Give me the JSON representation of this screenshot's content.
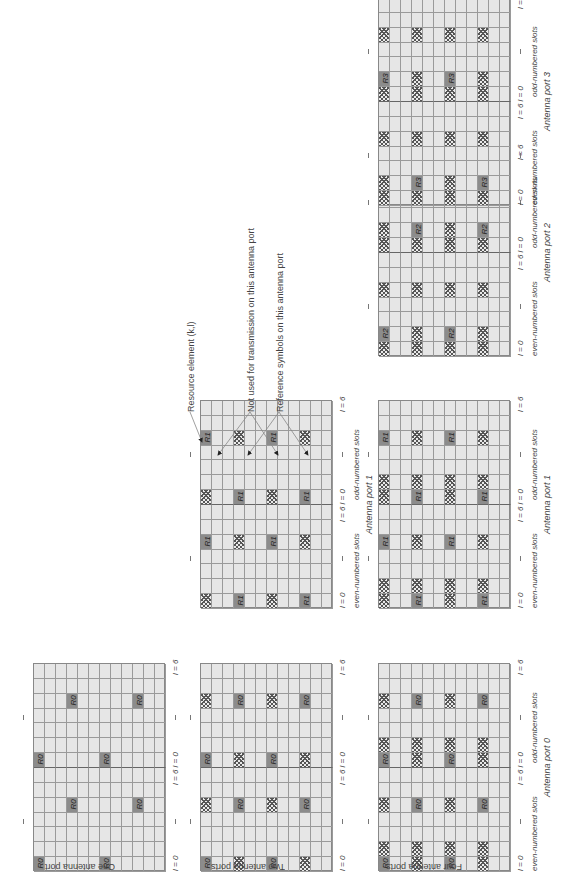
{
  "figure": {
    "row_labels": {
      "one": "One antenna port",
      "two": "Two antenna ports",
      "four": "Four antenna ports"
    },
    "axis_labels": {
      "l0": "l = 0",
      "l6l0": "l = 6 l = 0",
      "l6": "l = 6",
      "even": "even-numbered slots",
      "odd": "odd-numbered slots"
    },
    "port_labels": [
      "Antenna port 0",
      "Antenna port 1",
      "Antenna port 2",
      "Antenna port 3"
    ],
    "legend": {
      "resource_element": "Resource element (k,l)",
      "not_used": "Not used for transmission on this antenna port",
      "reference": "Reference symbols on this antenna port"
    },
    "colors": {
      "grid_bg": "#e6e6e6",
      "grid_line": "#9a9a9a",
      "ref_symbol": "#8c8c8c",
      "hatch": "#555555"
    },
    "grid": {
      "subcarriers": 12,
      "symbols": 14
    }
  },
  "grids": [
    {
      "id": "one-p0",
      "col": 0,
      "row": 0,
      "port": 0,
      "ref": "R0",
      "refs": [
        [
          0,
          0
        ],
        [
          6,
          0
        ],
        [
          3,
          4
        ],
        [
          9,
          4
        ],
        [
          0,
          7
        ],
        [
          6,
          7
        ],
        [
          3,
          11
        ],
        [
          9,
          11
        ]
      ],
      "hatch": []
    },
    {
      "id": "two-p0",
      "col": 1,
      "row": 0,
      "port": 0,
      "ref": "R0",
      "refs": [
        [
          0,
          0
        ],
        [
          6,
          0
        ],
        [
          3,
          4
        ],
        [
          9,
          4
        ],
        [
          0,
          7
        ],
        [
          6,
          7
        ],
        [
          3,
          11
        ],
        [
          9,
          11
        ]
      ],
      "hatch": [
        [
          3,
          0
        ],
        [
          9,
          0
        ],
        [
          0,
          4
        ],
        [
          6,
          4
        ],
        [
          3,
          7
        ],
        [
          9,
          7
        ],
        [
          0,
          11
        ],
        [
          6,
          11
        ]
      ]
    },
    {
      "id": "two-p1",
      "col": 1,
      "row": 1,
      "port": 1,
      "ref": "R1",
      "refs": [
        [
          3,
          0
        ],
        [
          9,
          0
        ],
        [
          0,
          4
        ],
        [
          6,
          4
        ],
        [
          3,
          7
        ],
        [
          9,
          7
        ],
        [
          0,
          11
        ],
        [
          6,
          11
        ]
      ],
      "hatch": [
        [
          0,
          0
        ],
        [
          6,
          0
        ],
        [
          3,
          4
        ],
        [
          9,
          4
        ],
        [
          0,
          7
        ],
        [
          6,
          7
        ],
        [
          3,
          11
        ],
        [
          9,
          11
        ]
      ]
    },
    {
      "id": "four-p0",
      "col": 2,
      "row": 0,
      "port": 0,
      "ref": "R0",
      "refs": [
        [
          0,
          0
        ],
        [
          6,
          0
        ],
        [
          3,
          4
        ],
        [
          9,
          4
        ],
        [
          0,
          7
        ],
        [
          6,
          7
        ],
        [
          3,
          11
        ],
        [
          9,
          11
        ]
      ],
      "hatch": [
        [
          3,
          0
        ],
        [
          9,
          0
        ],
        [
          0,
          4
        ],
        [
          6,
          4
        ],
        [
          3,
          7
        ],
        [
          9,
          7
        ],
        [
          0,
          11
        ],
        [
          6,
          11
        ],
        [
          0,
          1
        ],
        [
          3,
          1
        ],
        [
          6,
          1
        ],
        [
          9,
          1
        ],
        [
          0,
          8
        ],
        [
          3,
          8
        ],
        [
          6,
          8
        ],
        [
          9,
          8
        ]
      ]
    },
    {
      "id": "four-p1",
      "col": 2,
      "row": 1,
      "port": 1,
      "ref": "R1",
      "refs": [
        [
          3,
          0
        ],
        [
          9,
          0
        ],
        [
          0,
          4
        ],
        [
          6,
          4
        ],
        [
          3,
          7
        ],
        [
          9,
          7
        ],
        [
          0,
          11
        ],
        [
          6,
          11
        ]
      ],
      "hatch": [
        [
          0,
          0
        ],
        [
          6,
          0
        ],
        [
          3,
          4
        ],
        [
          9,
          4
        ],
        [
          0,
          7
        ],
        [
          6,
          7
        ],
        [
          3,
          11
        ],
        [
          9,
          11
        ],
        [
          0,
          1
        ],
        [
          3,
          1
        ],
        [
          6,
          1
        ],
        [
          9,
          1
        ],
        [
          0,
          8
        ],
        [
          3,
          8
        ],
        [
          6,
          8
        ],
        [
          9,
          8
        ]
      ]
    },
    {
      "id": "four-p2",
      "col": 2,
      "row": 2,
      "port": 2,
      "ref": "R2",
      "refs": [
        [
          0,
          1
        ],
        [
          6,
          1
        ],
        [
          3,
          8
        ],
        [
          9,
          8
        ]
      ],
      "hatch": [
        [
          3,
          1
        ],
        [
          9,
          1
        ],
        [
          0,
          8
        ],
        [
          6,
          8
        ],
        [
          0,
          0
        ],
        [
          3,
          0
        ],
        [
          6,
          0
        ],
        [
          9,
          0
        ],
        [
          0,
          4
        ],
        [
          3,
          4
        ],
        [
          6,
          4
        ],
        [
          9,
          4
        ],
        [
          0,
          7
        ],
        [
          3,
          7
        ],
        [
          6,
          7
        ],
        [
          9,
          7
        ],
        [
          0,
          11
        ],
        [
          3,
          11
        ],
        [
          6,
          11
        ],
        [
          9,
          11
        ]
      ]
    },
    {
      "id": "four-p3",
      "col": 2,
      "row": 3,
      "port": 3,
      "ref": "R3",
      "refs": [
        [
          3,
          1
        ],
        [
          9,
          1
        ],
        [
          0,
          8
        ],
        [
          6,
          8
        ]
      ],
      "hatch": [
        [
          0,
          1
        ],
        [
          6,
          1
        ],
        [
          3,
          8
        ],
        [
          9,
          8
        ],
        [
          0,
          0
        ],
        [
          3,
          0
        ],
        [
          6,
          0
        ],
        [
          9,
          0
        ],
        [
          0,
          4
        ],
        [
          3,
          4
        ],
        [
          6,
          4
        ],
        [
          9,
          4
        ],
        [
          0,
          7
        ],
        [
          3,
          7
        ],
        [
          6,
          7
        ],
        [
          9,
          7
        ],
        [
          0,
          11
        ],
        [
          3,
          11
        ],
        [
          6,
          11
        ],
        [
          9,
          11
        ]
      ]
    }
  ],
  "chart_data": {
    "type": "diagram",
    "configurations": [
      "One antenna port",
      "Two antenna ports",
      "Four antenna ports"
    ],
    "ports": [
      "Antenna port 0",
      "Antenna port 1",
      "Antenna port 2",
      "Antenna port 3"
    ],
    "symbols": [
      "R0",
      "R1",
      "R2",
      "R3"
    ]
  }
}
